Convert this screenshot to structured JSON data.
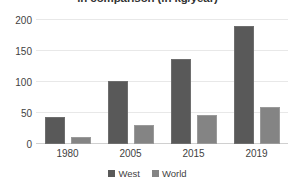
{
  "chart_data": {
    "type": "bar",
    "title": "in comparison (in kg/year)",
    "xlabel": "",
    "ylabel": "",
    "categories": [
      "1980",
      "2005",
      "2015",
      "2019"
    ],
    "series": [
      {
        "name": "West",
        "values": [
          44,
          102,
          137,
          190
        ],
        "color": "#595959"
      },
      {
        "name": "World",
        "values": [
          11,
          31,
          46,
          60
        ],
        "color": "#848484"
      }
    ],
    "ylim": [
      0,
      200
    ],
    "yticks": [
      0,
      50,
      100,
      150,
      200
    ],
    "ytick_labels": [
      "0",
      "50",
      "100",
      "150",
      "200"
    ],
    "grid": true,
    "legend_position": "bottom"
  }
}
